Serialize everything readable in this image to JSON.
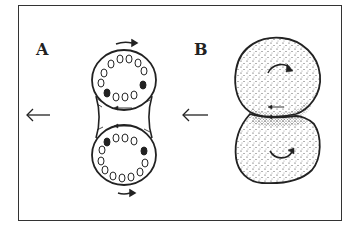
{
  "figure": {
    "panels": [
      {
        "label": "A",
        "description": "Two rounded cells joined by a connecting membrane bridge, each ring of small circles with two filled dots; tangential arrows show counter-rotation",
        "direction_arrow": "←"
      },
      {
        "label": "B",
        "description": "Two stippled spherical bodies in contact, curved arrows showing opposite rotation, small arrows at contact zone",
        "direction_arrow": "←"
      }
    ],
    "colors": {
      "ink": "#222222",
      "frame": "#333333",
      "background": "#ffffff"
    }
  }
}
